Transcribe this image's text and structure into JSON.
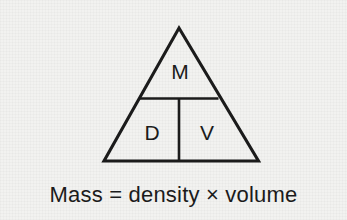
{
  "figure": {
    "kind": "formula-triangle",
    "background_color": "#f2f2f0",
    "ink_color": "#1b1b1b"
  },
  "triangle": {
    "cells": [
      {
        "id": "top",
        "label": "M",
        "meaning": "Mass"
      },
      {
        "id": "bottom-left",
        "label": "D",
        "meaning": "density"
      },
      {
        "id": "bottom-right",
        "label": "V",
        "meaning": "volume"
      }
    ]
  },
  "caption": {
    "text": "Mass = density × volume",
    "parts": {
      "subject": "Mass",
      "equals": "=",
      "factor_one": "density",
      "times": "×",
      "factor_two": "volume"
    }
  }
}
